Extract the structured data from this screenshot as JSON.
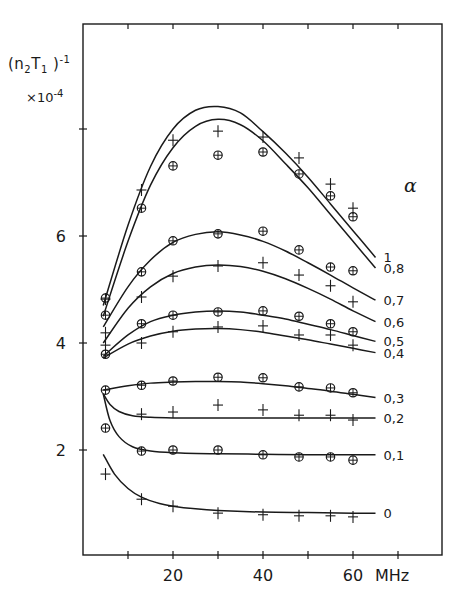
{
  "chart_data": {
    "type": "line",
    "title": "",
    "ylabel": "(n2T1)^-1",
    "ylabel_parts": {
      "base": "(n",
      "sub1": "2",
      "mid": "T",
      "sub2": "1",
      "close": " )",
      "sup": "-1"
    },
    "yscale_label": "×10",
    "yscale_exp": "-4",
    "xlabel": "MHz",
    "x_ticks": [
      10,
      20,
      30,
      40,
      50,
      60,
      70
    ],
    "x_tick_labels": [
      "20",
      "40",
      "60"
    ],
    "x_tick_label_values": [
      20,
      40,
      60
    ],
    "y_ticks": [
      2,
      4,
      6,
      8
    ],
    "y_tick_labels": [
      "2",
      "4",
      "6"
    ],
    "y_tick_label_values": [
      2,
      4,
      6
    ],
    "xlim": [
      0,
      80
    ],
    "ylim": [
      0,
      10
    ],
    "grid": false,
    "legend_title": "α",
    "legend_position": "right, curve-end labels",
    "x": [
      5,
      13,
      20,
      30,
      40,
      48,
      55,
      60
    ],
    "series": [
      {
        "name": "1",
        "marker": "plus",
        "values": [
          4.82,
          6.86,
          7.79,
          7.96,
          7.85,
          7.46,
          6.97,
          6.52
        ],
        "curve": [
          [
            4.5,
            4.7
          ],
          [
            10,
            6.2
          ],
          [
            15,
            7.3
          ],
          [
            20,
            8.0
          ],
          [
            25,
            8.35
          ],
          [
            30,
            8.42
          ],
          [
            35,
            8.3
          ],
          [
            40,
            7.95
          ],
          [
            45,
            7.55
          ],
          [
            50,
            7.1
          ],
          [
            55,
            6.6
          ],
          [
            60,
            6.1
          ],
          [
            65,
            5.6
          ]
        ]
      },
      {
        "name": "0,8",
        "marker": "circle",
        "values": [
          4.84,
          6.52,
          7.31,
          7.51,
          7.57,
          7.16,
          6.75,
          6.36
        ],
        "curve": [
          [
            4.5,
            4.5
          ],
          [
            10,
            5.9
          ],
          [
            15,
            6.95
          ],
          [
            20,
            7.65
          ],
          [
            25,
            8.05
          ],
          [
            30,
            8.18
          ],
          [
            35,
            8.08
          ],
          [
            40,
            7.78
          ],
          [
            45,
            7.35
          ],
          [
            50,
            6.9
          ],
          [
            55,
            6.4
          ],
          [
            60,
            5.9
          ],
          [
            65,
            5.4
          ]
        ]
      },
      {
        "name": "0,7",
        "marker": "circle",
        "values": [
          4.52,
          5.33,
          5.91,
          6.04,
          6.09,
          5.74,
          5.42,
          5.35
        ],
        "curve": [
          [
            4.5,
            4.3
          ],
          [
            10,
            5.05
          ],
          [
            15,
            5.55
          ],
          [
            20,
            5.88
          ],
          [
            25,
            6.03
          ],
          [
            30,
            6.08
          ],
          [
            35,
            6.02
          ],
          [
            40,
            5.9
          ],
          [
            45,
            5.72
          ],
          [
            50,
            5.5
          ],
          [
            55,
            5.27
          ],
          [
            60,
            5.03
          ],
          [
            65,
            4.8
          ]
        ]
      },
      {
        "name": "0,6",
        "marker": "plus",
        "values": [
          4.19,
          4.86,
          5.25,
          5.44,
          5.5,
          5.27,
          5.07,
          4.77
        ],
        "curve": [
          [
            4.5,
            4.0
          ],
          [
            10,
            4.65
          ],
          [
            15,
            5.05
          ],
          [
            20,
            5.3
          ],
          [
            25,
            5.42
          ],
          [
            30,
            5.46
          ],
          [
            35,
            5.43
          ],
          [
            40,
            5.34
          ],
          [
            45,
            5.2
          ],
          [
            50,
            5.02
          ],
          [
            55,
            4.82
          ],
          [
            60,
            4.6
          ],
          [
            65,
            4.4
          ]
        ]
      },
      {
        "name": "0,5",
        "marker": "circle",
        "values": [
          3.79,
          4.36,
          4.52,
          4.58,
          4.6,
          4.5,
          4.36,
          4.21
        ],
        "curve": [
          [
            4.5,
            3.75
          ],
          [
            10,
            4.15
          ],
          [
            15,
            4.4
          ],
          [
            20,
            4.52
          ],
          [
            25,
            4.58
          ],
          [
            30,
            4.6
          ],
          [
            35,
            4.58
          ],
          [
            40,
            4.52
          ],
          [
            45,
            4.45
          ],
          [
            50,
            4.35
          ],
          [
            55,
            4.25
          ],
          [
            60,
            4.14
          ],
          [
            65,
            4.03
          ]
        ]
      },
      {
        "name": "0,4",
        "marker": "plus",
        "values": [
          3.96,
          4.0,
          4.21,
          4.3,
          4.32,
          4.15,
          4.15,
          3.96
        ],
        "curve": [
          [
            4.5,
            3.72
          ],
          [
            10,
            3.98
          ],
          [
            15,
            4.13
          ],
          [
            20,
            4.22
          ],
          [
            25,
            4.26
          ],
          [
            30,
            4.27
          ],
          [
            35,
            4.25
          ],
          [
            40,
            4.2
          ],
          [
            45,
            4.13
          ],
          [
            50,
            4.06
          ],
          [
            55,
            3.98
          ],
          [
            60,
            3.9
          ],
          [
            65,
            3.82
          ]
        ]
      },
      {
        "name": "0,3",
        "marker": "circle",
        "values": [
          3.12,
          3.21,
          3.29,
          3.36,
          3.35,
          3.18,
          3.16,
          3.07
        ],
        "curve": [
          [
            4.5,
            3.12
          ],
          [
            10,
            3.2
          ],
          [
            15,
            3.25
          ],
          [
            20,
            3.27
          ],
          [
            25,
            3.28
          ],
          [
            30,
            3.28
          ],
          [
            35,
            3.27
          ],
          [
            40,
            3.24
          ],
          [
            45,
            3.2
          ],
          [
            50,
            3.15
          ],
          [
            55,
            3.1
          ],
          [
            60,
            3.04
          ],
          [
            65,
            2.98
          ]
        ]
      },
      {
        "name": "0,2",
        "marker": "plus",
        "values": [
          null,
          2.67,
          2.71,
          2.84,
          2.75,
          2.65,
          2.65,
          2.56
        ],
        "curve": [
          [
            4.5,
            3.05
          ],
          [
            6,
            2.85
          ],
          [
            8,
            2.72
          ],
          [
            11,
            2.64
          ],
          [
            15,
            2.61
          ],
          [
            20,
            2.6
          ],
          [
            30,
            2.6
          ],
          [
            40,
            2.6
          ],
          [
            50,
            2.6
          ],
          [
            60,
            2.6
          ],
          [
            65,
            2.6
          ]
        ]
      },
      {
        "name": "0,1",
        "marker": "circle",
        "values": [
          2.41,
          1.98,
          2.0,
          2.0,
          1.91,
          1.87,
          1.87,
          1.81
        ],
        "curve": [
          [
            4.5,
            3.05
          ],
          [
            6,
            2.55
          ],
          [
            8,
            2.25
          ],
          [
            11,
            2.06
          ],
          [
            15,
            1.98
          ],
          [
            20,
            1.95
          ],
          [
            30,
            1.93
          ],
          [
            40,
            1.92
          ],
          [
            50,
            1.91
          ],
          [
            60,
            1.91
          ],
          [
            65,
            1.91
          ]
        ]
      },
      {
        "name": "0",
        "marker": "plus",
        "values": [
          1.55,
          1.08,
          0.95,
          0.82,
          0.79,
          0.77,
          0.77,
          0.75
        ],
        "curve": [
          [
            4.5,
            1.92
          ],
          [
            7,
            1.55
          ],
          [
            10,
            1.28
          ],
          [
            13,
            1.12
          ],
          [
            17,
            1.0
          ],
          [
            20,
            0.95
          ],
          [
            25,
            0.9
          ],
          [
            30,
            0.87
          ],
          [
            40,
            0.84
          ],
          [
            50,
            0.83
          ],
          [
            60,
            0.82
          ],
          [
            65,
            0.82
          ]
        ]
      }
    ]
  }
}
